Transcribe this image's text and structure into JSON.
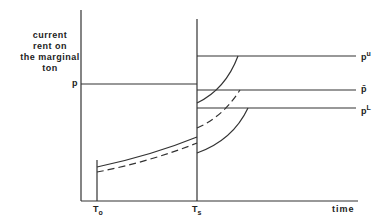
{
  "diagram": {
    "y_axis_label": [
      "current",
      "rent on",
      "the marginal",
      "ton"
    ],
    "x_axis_label": "time",
    "x_ticks": [
      {
        "base": "T",
        "sub": "o"
      },
      {
        "base": "T",
        "sub": "s"
      }
    ],
    "left_level": {
      "label": "p"
    },
    "right_levels": [
      {
        "base": "p",
        "sup": "u"
      },
      {
        "base": "p̄",
        "sup": ""
      },
      {
        "base": "p",
        "sup": "L"
      }
    ],
    "colors": {
      "line": "#333333",
      "background": "#ffffff"
    }
  }
}
